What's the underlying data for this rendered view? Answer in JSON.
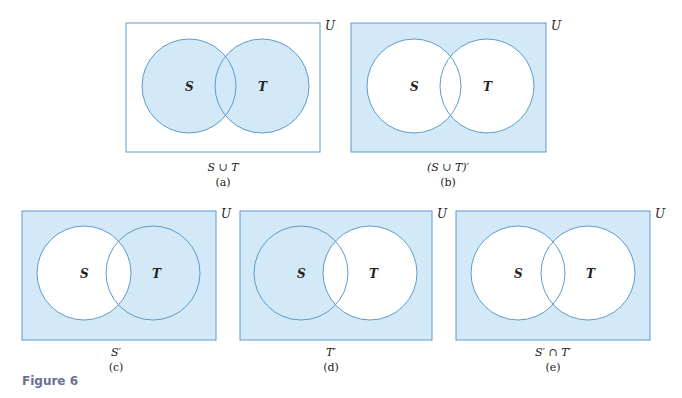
{
  "figure": {
    "caption": "Figure 6",
    "universe_label": "U",
    "set_a_label": "S",
    "set_b_label": "T",
    "colors": {
      "shade": "#d3e9f7",
      "stroke": "#5d9ccd",
      "background": "#ffffff",
      "caption": "#6a7090"
    }
  },
  "panels": [
    {
      "id": "a",
      "expression": "S ∪ T",
      "sublabel": "(a)",
      "shaded_region": "S union T"
    },
    {
      "id": "b",
      "expression": "(S ∪ T)′",
      "sublabel": "(b)",
      "shaded_region": "complement of S union T"
    },
    {
      "id": "c",
      "expression": "S′",
      "sublabel": "(c)",
      "shaded_region": "complement of S"
    },
    {
      "id": "d",
      "expression": "T′",
      "sublabel": "(d)",
      "shaded_region": "complement of T"
    },
    {
      "id": "e",
      "expression": "S′ ∩ T′",
      "sublabel": "(e)",
      "shaded_region": "complement of S intersect complement of T"
    }
  ]
}
